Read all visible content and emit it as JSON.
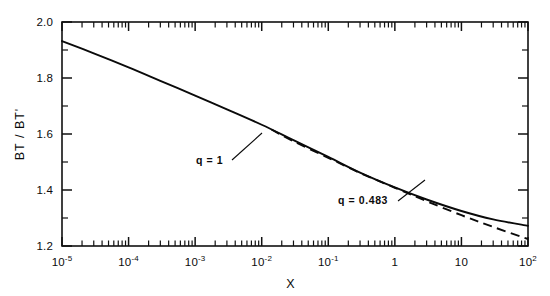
{
  "chart_data": {
    "type": "line",
    "title": "",
    "xlabel": "X",
    "ylabel": "BT / BT'",
    "xscale": "log",
    "yscale": "linear",
    "xlim": [
      1e-05,
      100
    ],
    "ylim": [
      1.2,
      2.0
    ],
    "grid": false,
    "legend_position": "inline-annotations",
    "x_tick_labels": [
      {
        "value": 1e-05,
        "mantissa": "10",
        "exponent": "-5",
        "text": "10^-5"
      },
      {
        "value": 0.0001,
        "mantissa": "10",
        "exponent": "-4",
        "text": "10^-4"
      },
      {
        "value": 0.001,
        "mantissa": "10",
        "exponent": "-3",
        "text": "10^-3"
      },
      {
        "value": 0.01,
        "mantissa": "10",
        "exponent": "-2",
        "text": "10^-2"
      },
      {
        "value": 0.1,
        "mantissa": "10",
        "exponent": "-1",
        "text": "10^-1"
      },
      {
        "value": 1,
        "mantissa": "1",
        "exponent": "",
        "text": "1"
      },
      {
        "value": 10,
        "mantissa": "10",
        "exponent": "",
        "text": "10"
      },
      {
        "value": 100,
        "mantissa": "10",
        "exponent": "2",
        "text": "10^2"
      }
    ],
    "y_tick_labels": [
      {
        "value": 2.0,
        "text": "2.0"
      },
      {
        "value": 1.8,
        "text": "1.8"
      },
      {
        "value": 1.6,
        "text": "1.6"
      },
      {
        "value": 1.4,
        "text": "1.4"
      },
      {
        "value": 1.2,
        "text": "1.2"
      }
    ],
    "y_minor_ticks": [
      1.9,
      1.7,
      1.5,
      1.3
    ],
    "series": [
      {
        "name": "q = 1",
        "style": "solid",
        "annotation": "q = 1",
        "points": [
          [
            1e-05,
            1.932
          ],
          [
            3e-05,
            1.888
          ],
          [
            0.0001,
            1.838
          ],
          [
            0.0003,
            1.79
          ],
          [
            0.001,
            1.737
          ],
          [
            0.003,
            1.688
          ],
          [
            0.01,
            1.633
          ],
          [
            0.03,
            1.578
          ],
          [
            0.1,
            1.518
          ],
          [
            0.3,
            1.462
          ],
          [
            1.0,
            1.409
          ],
          [
            3.0,
            1.366
          ],
          [
            10.0,
            1.325
          ],
          [
            30.0,
            1.295
          ],
          [
            100.0,
            1.272
          ]
        ]
      },
      {
        "name": "q = 0.483",
        "style": "dashed",
        "annotation": "q = 0.483",
        "points": [
          [
            0.014,
            1.616
          ],
          [
            0.03,
            1.574
          ],
          [
            0.1,
            1.515
          ],
          [
            0.3,
            1.461
          ],
          [
            1.0,
            1.408
          ],
          [
            3.0,
            1.36
          ],
          [
            10.0,
            1.31
          ],
          [
            30.0,
            1.268
          ],
          [
            100.0,
            1.225
          ]
        ]
      }
    ],
    "annotations": [
      {
        "text": "q = 1",
        "x_px": 196,
        "y_px": 164,
        "leader_from": [
          232,
          160
        ],
        "leader_to": [
          262,
          133
        ]
      },
      {
        "text": "q = 0.483",
        "x_px": 338,
        "y_px": 204,
        "leader_from": [
          398,
          201
        ],
        "leader_to": [
          425,
          180
        ]
      }
    ]
  },
  "axes": {
    "x_title": "X",
    "y_title": "BT / BT'"
  }
}
